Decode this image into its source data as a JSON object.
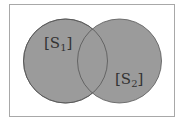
{
  "diagram": {
    "type": "venn",
    "colors": {
      "fill": "#9b9b9b",
      "stroke": "#555555",
      "frame": "#a8a8a8",
      "text": "#333333"
    },
    "sets": [
      {
        "name": "S1",
        "label_open": "[S",
        "label_sub": "1",
        "label_close": "]"
      },
      {
        "name": "S2",
        "label_open": "[S",
        "label_sub": "2",
        "label_close": "]"
      }
    ]
  }
}
